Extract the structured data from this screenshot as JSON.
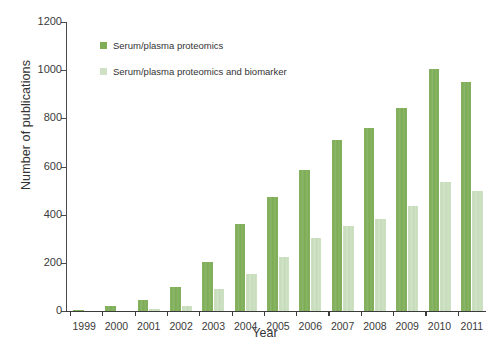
{
  "chart_data": {
    "type": "bar",
    "title": "",
    "xlabel": "Year",
    "ylabel": "Number of publications",
    "categories": [
      "1999",
      "2000",
      "2001",
      "2002",
      "2003",
      "2004",
      "2005",
      "2006",
      "2007",
      "2008",
      "2009",
      "2010",
      "2011"
    ],
    "series": [
      {
        "name": "Serum/plasma proteomics",
        "color": "#7fae57",
        "values": [
          5,
          20,
          45,
          100,
          205,
          360,
          475,
          585,
          710,
          760,
          845,
          1005,
          950
        ]
      },
      {
        "name": "Serum/plasma proteomics and biomarker",
        "color": "#cfe1c4",
        "values": [
          0,
          2,
          8,
          20,
          90,
          155,
          225,
          305,
          355,
          380,
          435,
          535,
          500
        ]
      }
    ],
    "ylim": [
      0,
      1200
    ],
    "yticks": [
      0,
      200,
      400,
      600,
      800,
      1000,
      1200
    ],
    "ytick_labels": [
      "0",
      "200",
      "400",
      "600",
      "800",
      "1000",
      "1200"
    ],
    "grid": false,
    "legend_position": "upper-left-inside"
  },
  "legend": {
    "entries": [
      {
        "label": "Serum/plasma proteomics",
        "color": "#7fae57"
      },
      {
        "label": "Serum/plasma proteomics and biomarker",
        "color": "#cfe1c4"
      }
    ]
  },
  "axes": {
    "x_title": "Year",
    "y_title": "Number of publications"
  }
}
